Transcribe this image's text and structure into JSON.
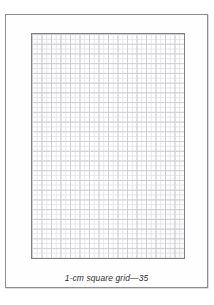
{
  "page": {
    "kind": "worksheet-sheet",
    "background_color": "#ffffff",
    "sheet_fill": "#fefefe",
    "sheet_border_color": "#8d8d90"
  },
  "grid": {
    "label": "1-cm square grid",
    "major_columns": 16,
    "major_rows": 23,
    "minor_per_major": 2,
    "major_line_color": "#cfcfd4",
    "minor_line_color": "#e6e6ea",
    "border_color": "#7e7e84",
    "fill_color": "#ffffff"
  },
  "caption": {
    "text": "1-cm square grid—35",
    "page_number": "35",
    "description": "1-cm square grid",
    "color": "#2f2f33"
  }
}
